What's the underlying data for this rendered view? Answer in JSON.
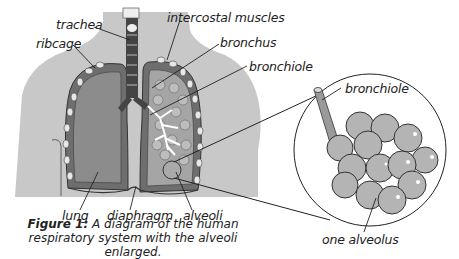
{
  "figure": {
    "labels": {
      "trachea": "trachea",
      "ribcage": "ribcage",
      "intercostal_muscles": "intercostal muscles",
      "bronchus": "bronchus",
      "bronchiole": "bronchiole",
      "lung": "lung",
      "diaphragm": "diaphragm",
      "alveoli": "alveoli",
      "inset_bronchiole": "bronchiole",
      "one_alveolus": "one alveolus"
    },
    "caption": {
      "number": "Figure 1:",
      "text": "A diagram of the human respiratory system with the alveoli enlarged."
    },
    "colors": {
      "body": "#c8c8c8",
      "lung_outer": "#6e6e6e",
      "lung_fill": "#8c8c8c",
      "trachea": "#444444",
      "alveolus": "#b4b4b4",
      "lines": "#222222"
    }
  }
}
